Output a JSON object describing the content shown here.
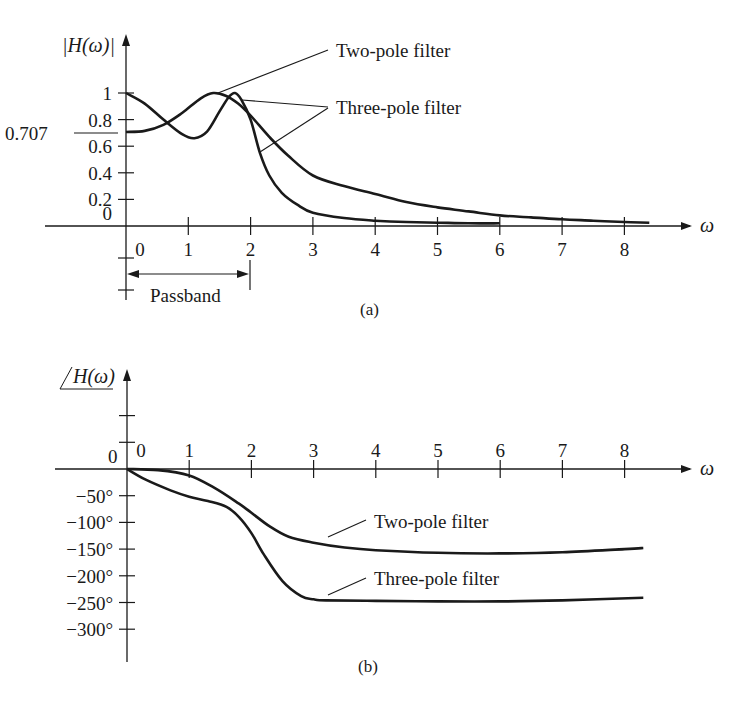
{
  "colors": {
    "ink": "#1a1a1a",
    "background": "#ffffff"
  },
  "chart_data": [
    {
      "id": "a",
      "type": "line",
      "caption": "(a)",
      "title": "",
      "xlabel": "ω",
      "ylabel": "|H(ω)|",
      "xlim": [
        0,
        8.5
      ],
      "ylim": [
        0,
        1.1
      ],
      "x_ticks": [
        0,
        1,
        2,
        3,
        4,
        5,
        6,
        7,
        8
      ],
      "x_tick_labels": [
        "0",
        "1",
        "2",
        "3",
        "4",
        "5",
        "6",
        "7",
        "8"
      ],
      "y_ticks": [
        0,
        0.2,
        0.4,
        0.6,
        0.8,
        1
      ],
      "y_tick_labels": [
        "0",
        "0.2",
        "0.4",
        "0.6",
        "0.8",
        "1"
      ],
      "extra_y_label": {
        "value": 0.707,
        "text": "0.707"
      },
      "grid": false,
      "legend": "none (leader-line annotations)",
      "annotations": [
        {
          "text": "Two-pole filter",
          "target": "two_pole_peak"
        },
        {
          "text": "Three-pole filter",
          "target": "three_pole_peak_and_rolloff"
        },
        {
          "text": "Passband",
          "span": [
            0,
            2
          ]
        }
      ],
      "series": [
        {
          "name": "Two-pole filter",
          "x": [
            0,
            0.3,
            0.6,
            0.9,
            1.2,
            1.4,
            1.6,
            1.8,
            2.0,
            2.3,
            2.6,
            3.0,
            3.5,
            4.0,
            4.5,
            5.0,
            5.5,
            6.0,
            6.5,
            7.0,
            7.5,
            8.0,
            8.4
          ],
          "values": [
            0.707,
            0.715,
            0.76,
            0.85,
            0.96,
            1.0,
            0.98,
            0.92,
            0.83,
            0.67,
            0.53,
            0.38,
            0.3,
            0.24,
            0.18,
            0.14,
            0.11,
            0.08,
            0.065,
            0.05,
            0.04,
            0.03,
            0.025
          ]
        },
        {
          "name": "Three-pole filter",
          "x": [
            0,
            0.3,
            0.6,
            0.9,
            1.1,
            1.3,
            1.5,
            1.65,
            1.75,
            1.85,
            2.0,
            2.15,
            2.3,
            2.5,
            2.75,
            3.0,
            3.5,
            4.0,
            4.5,
            5.0,
            5.5,
            6.0
          ],
          "values": [
            1.0,
            0.92,
            0.8,
            0.69,
            0.66,
            0.71,
            0.86,
            0.97,
            1.0,
            0.95,
            0.8,
            0.55,
            0.38,
            0.25,
            0.16,
            0.1,
            0.06,
            0.04,
            0.03,
            0.025,
            0.02,
            0.02
          ]
        }
      ]
    },
    {
      "id": "b",
      "type": "line",
      "caption": "(b)",
      "title": "",
      "xlabel": "ω",
      "ylabel": "∠H(ω)",
      "xlim": [
        0,
        8.5
      ],
      "ylim": [
        -300,
        100
      ],
      "x_ticks": [
        0,
        1,
        2,
        3,
        4,
        5,
        6,
        7,
        8
      ],
      "x_tick_labels": [
        "0",
        "1",
        "2",
        "3",
        "4",
        "5",
        "6",
        "7",
        "8"
      ],
      "y_ticks": [
        100,
        50,
        0,
        -50,
        -100,
        -150,
        -200,
        -250,
        -300
      ],
      "y_tick_labels": [
        "",
        "",
        "0",
        "−50°",
        "−100°",
        "−150°",
        "−200°",
        "−250°",
        "−300°"
      ],
      "grid": false,
      "legend": "none (leader-line annotations)",
      "annotations": [
        {
          "text": "Two-pole filter"
        },
        {
          "text": "Three-pole filter"
        }
      ],
      "series": [
        {
          "name": "Two-pole filter",
          "x": [
            0,
            0.5,
            1.0,
            1.4,
            1.8,
            2.0,
            2.3,
            2.6,
            3.0,
            3.5,
            4.0,
            5.0,
            6.0,
            7.0,
            8.0,
            8.3
          ],
          "values": [
            0,
            -2,
            -12,
            -35,
            -65,
            -82,
            -108,
            -127,
            -138,
            -147,
            -152,
            -157,
            -158,
            -156,
            -150,
            -148
          ]
        },
        {
          "name": "Three-pole filter",
          "x": [
            0,
            0.3,
            0.7,
            1.0,
            1.3,
            1.6,
            1.8,
            2.0,
            2.2,
            2.5,
            2.8,
            3.0,
            3.2,
            4.0,
            5.0,
            6.0,
            7.0,
            8.3
          ],
          "values": [
            0,
            -20,
            -40,
            -52,
            -60,
            -71,
            -90,
            -120,
            -160,
            -210,
            -238,
            -244,
            -246,
            -247,
            -248,
            -248,
            -246,
            -241
          ]
        }
      ]
    }
  ],
  "labels": {
    "a_ylabel": "|H(ω)|",
    "a_xlabel": "ω",
    "a_two_pole": "Two-pole filter",
    "a_three_pole": "Three-pole filter",
    "a_passband": "Passband",
    "a_0707": "0.707",
    "a_caption": "(a)",
    "b_ylabel": "H(ω)",
    "b_xlabel": "ω",
    "b_two_pole": "Two-pole filter",
    "b_three_pole": "Three-pole filter",
    "b_caption": "(b)",
    "b_zero_left": "0"
  }
}
